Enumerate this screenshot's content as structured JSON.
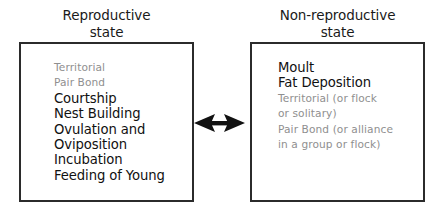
{
  "diagram": {
    "background_color": "#ffffff",
    "box_border_color": "#2b2b2b",
    "active_text_color": "#111111",
    "faded_text_color": "#8f8f8f",
    "panels": [
      {
        "id": "reproductive",
        "title": "Reproductive\nstate",
        "items": [
          {
            "label": "Territorial",
            "state": "faded"
          },
          {
            "label": "Pair Bond",
            "state": "faded"
          },
          {
            "label": "Courtship",
            "state": "active"
          },
          {
            "label": "Nest Building",
            "state": "active"
          },
          {
            "label": "Ovulation and",
            "state": "active"
          },
          {
            "label": "Oviposition",
            "state": "active"
          },
          {
            "label": "Incubation",
            "state": "active"
          },
          {
            "label": "Feeding of Young",
            "state": "active"
          }
        ]
      },
      {
        "id": "non-reproductive",
        "title": "Non-reproductive\nstate",
        "items": [
          {
            "label": "Moult",
            "state": "active"
          },
          {
            "label": "Fat Deposition",
            "state": "active"
          },
          {
            "label": "Territorial (or flock\nor solitary)",
            "state": "faded"
          },
          {
            "label": "Pair Bond (or alliance\nin a group or flock)",
            "state": "faded"
          }
        ]
      }
    ],
    "connector": {
      "kind": "double-headed-arrow",
      "color": "#111111"
    }
  }
}
